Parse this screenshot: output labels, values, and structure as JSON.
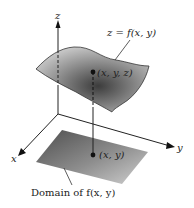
{
  "diagram": {
    "axes": {
      "x_label": "x",
      "y_label": "y",
      "z_label": "z"
    },
    "surface_label": "z = f(x, y)",
    "point_3d_label": "(x, y, z)",
    "point_2d_label": "(x, y)",
    "domain_label": "Domain of f(x, y)",
    "colors": {
      "axis": "#222222",
      "surface_dark": "#4a4a4a",
      "surface_light": "#d8d8d8",
      "domain_dark": "#5a5a5a",
      "domain_light": "#c8c8c8",
      "point": "#111111"
    }
  }
}
